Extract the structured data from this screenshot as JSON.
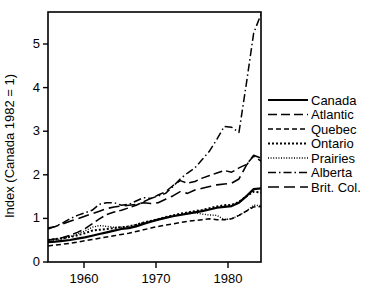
{
  "chart_data": {
    "type": "line",
    "title": "",
    "xlabel": "",
    "ylabel": "Index (Canada 1982 = 1)",
    "xlim": [
      1955,
      1984
    ],
    "ylim": [
      0,
      5.9
    ],
    "xticks": [
      1960,
      1970,
      1980
    ],
    "xtick_labels": [
      "1960",
      "1970",
      "1980"
    ],
    "yticks": [
      0,
      1,
      2,
      3,
      4,
      5
    ],
    "ytick_labels": [
      "0",
      "1",
      "2",
      "3",
      "4",
      "5"
    ],
    "grid": false,
    "legend_position": "right",
    "x": [
      1955,
      1956,
      1957,
      1958,
      1959,
      1960,
      1961,
      1962,
      1963,
      1964,
      1965,
      1966,
      1967,
      1968,
      1969,
      1970,
      1971,
      1972,
      1973,
      1974,
      1975,
      1976,
      1977,
      1978,
      1979,
      1980,
      1981,
      1982,
      1983,
      1984
    ],
    "series": [
      {
        "name": "Canada",
        "style": "solid",
        "values": [
          0.47,
          0.48,
          0.5,
          0.52,
          0.55,
          0.58,
          0.62,
          0.66,
          0.7,
          0.74,
          0.78,
          0.8,
          0.84,
          0.9,
          0.95,
          1.0,
          1.04,
          1.08,
          1.11,
          1.14,
          1.17,
          1.2,
          1.24,
          1.28,
          1.3,
          1.32,
          1.4,
          1.55,
          1.72,
          1.74
        ]
      },
      {
        "name": "Atlantic",
        "style": "dashed-long",
        "values": [
          0.52,
          0.54,
          0.58,
          0.63,
          0.7,
          0.78,
          0.9,
          1.02,
          1.12,
          1.18,
          1.22,
          1.28,
          1.34,
          1.42,
          1.5,
          1.58,
          1.66,
          1.8,
          1.92,
          1.86,
          1.9,
          1.98,
          2.04,
          2.1,
          2.16,
          2.12,
          2.22,
          2.3,
          2.5,
          2.38
        ]
      },
      {
        "name": "Quebec",
        "style": "dashed-short",
        "values": [
          0.38,
          0.4,
          0.42,
          0.44,
          0.47,
          0.5,
          0.53,
          0.56,
          0.59,
          0.62,
          0.65,
          0.68,
          0.72,
          0.76,
          0.8,
          0.84,
          0.87,
          0.9,
          0.93,
          0.96,
          0.98,
          1.0,
          1.02,
          1.0,
          1.0,
          1.02,
          1.1,
          1.2,
          1.3,
          1.31
        ]
      },
      {
        "name": "Ontario",
        "style": "dotted-coarse",
        "values": [
          0.52,
          0.54,
          0.56,
          0.59,
          0.63,
          0.68,
          0.74,
          0.76,
          0.78,
          0.8,
          0.82,
          0.84,
          0.88,
          0.93,
          0.97,
          1.01,
          1.06,
          1.1,
          1.14,
          1.17,
          1.2,
          1.23,
          1.27,
          1.31,
          1.34,
          1.35,
          1.42,
          1.55,
          1.66,
          1.64
        ]
      },
      {
        "name": "Prairies",
        "style": "dotted-fine",
        "values": [
          0.5,
          0.52,
          0.55,
          0.6,
          0.66,
          0.73,
          0.82,
          0.86,
          0.84,
          0.82,
          0.82,
          0.84,
          0.88,
          0.93,
          0.97,
          1.01,
          1.05,
          1.09,
          1.12,
          1.14,
          1.16,
          1.13,
          1.11,
          1.1,
          1.0,
          1.02,
          1.1,
          1.2,
          1.34,
          1.33
        ]
      },
      {
        "name": "Alberta",
        "style": "dash-dot",
        "values": [
          0.78,
          0.84,
          0.92,
          1.02,
          1.1,
          1.16,
          1.22,
          1.36,
          1.4,
          1.4,
          1.34,
          1.36,
          1.44,
          1.52,
          1.5,
          1.56,
          1.62,
          1.78,
          1.96,
          2.1,
          2.22,
          2.42,
          2.62,
          2.9,
          3.2,
          3.18,
          3.06,
          4.2,
          5.4,
          5.85
        ]
      },
      {
        "name": "Brit. Col.",
        "style": "dashed-medium",
        "values": [
          0.8,
          0.84,
          0.9,
          0.96,
          1.02,
          1.08,
          1.14,
          1.2,
          1.26,
          1.3,
          1.32,
          1.34,
          1.36,
          1.4,
          1.38,
          1.4,
          1.48,
          1.56,
          1.66,
          1.62,
          1.7,
          1.74,
          1.78,
          1.82,
          1.84,
          1.86,
          1.96,
          2.28,
          2.52,
          2.45
        ]
      }
    ]
  },
  "legend": {
    "entries": [
      {
        "label": "Canada",
        "style": "solid"
      },
      {
        "label": "Atlantic",
        "style": "dashed-long"
      },
      {
        "label": "Quebec",
        "style": "dashed-short"
      },
      {
        "label": "Ontario",
        "style": "dotted-coarse"
      },
      {
        "label": "Prairies",
        "style": "dotted-fine"
      },
      {
        "label": "Alberta",
        "style": "dash-dot"
      },
      {
        "label": "Brit. Col.",
        "style": "dashed-medium"
      }
    ]
  }
}
